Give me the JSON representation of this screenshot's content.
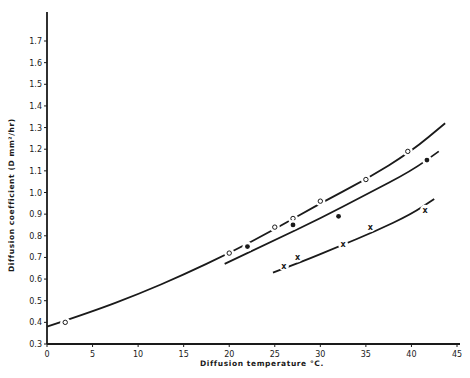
{
  "chart_data": {
    "type": "scatter",
    "title": "",
    "xlabel": "Diffusion temperature °C.",
    "ylabel": "Diffusion coefficient (D mm²/hr)",
    "xlim": [
      0,
      45
    ],
    "ylim": [
      0.3,
      1.75
    ],
    "grid": false,
    "legend": "none",
    "x_ticks": [
      0,
      5,
      10,
      15,
      20,
      25,
      30,
      35,
      40,
      45
    ],
    "x_tick_labels": [
      "0",
      "5",
      "10",
      "15",
      "20",
      "25",
      "30",
      "35",
      "40",
      "45"
    ],
    "y_ticks": [
      0.3,
      0.4,
      0.5,
      0.6,
      0.7,
      0.8,
      0.9,
      1.0,
      1.1,
      1.2,
      1.3,
      1.4,
      1.5,
      1.6,
      1.7
    ],
    "y_tick_labels": [
      "0.3",
      "0.4",
      "0.5",
      "0.6",
      "0.7",
      "0.8",
      "0.9",
      "1.0",
      "1.1",
      "1.2",
      "1.3",
      "1.4",
      "1.5",
      "1.6",
      "1.7"
    ],
    "series": [
      {
        "name": "open circles",
        "marker": "o",
        "points": [
          [
            2,
            0.4
          ],
          [
            20,
            0.72
          ],
          [
            25,
            0.84
          ],
          [
            27,
            0.88
          ],
          [
            30,
            0.96
          ],
          [
            35,
            1.06
          ],
          [
            39.6,
            1.19
          ]
        ],
        "fit_curve": [
          [
            0,
            0.38
          ],
          [
            5,
            0.45
          ],
          [
            10,
            0.53
          ],
          [
            15,
            0.62
          ],
          [
            20,
            0.72
          ],
          [
            25,
            0.83
          ],
          [
            30,
            0.95
          ],
          [
            35,
            1.06
          ],
          [
            40,
            1.19
          ],
          [
            43.7,
            1.32
          ]
        ]
      },
      {
        "name": "filled circles",
        "marker": "•",
        "points": [
          [
            22,
            0.75
          ],
          [
            27,
            0.85
          ],
          [
            32,
            0.89
          ],
          [
            41.7,
            1.15
          ]
        ],
        "fit_curve": [
          [
            19.5,
            0.67
          ],
          [
            25,
            0.78
          ],
          [
            30,
            0.88
          ],
          [
            35,
            0.99
          ],
          [
            40,
            1.1
          ],
          [
            43,
            1.19
          ]
        ]
      },
      {
        "name": "crosses",
        "marker": "x",
        "points": [
          [
            26,
            0.66
          ],
          [
            27.5,
            0.7
          ],
          [
            32.5,
            0.76
          ],
          [
            35.5,
            0.84
          ],
          [
            41.5,
            0.92
          ]
        ],
        "fit_curve": [
          [
            24.8,
            0.63
          ],
          [
            28,
            0.68
          ],
          [
            32,
            0.75
          ],
          [
            36,
            0.82
          ],
          [
            40,
            0.9
          ],
          [
            42.5,
            0.97
          ]
        ]
      }
    ]
  }
}
